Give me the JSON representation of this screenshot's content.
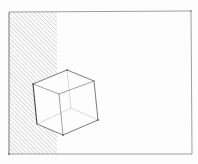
{
  "drawing": {
    "subject": "pencil sketch of wireframe cube beside hatched wall",
    "colors": {
      "paper": "#fdfdfd",
      "line": "#5a5a5a",
      "light_line": "#9a9a9a",
      "hatch": "#a8a8a8"
    },
    "frame": {
      "x1": 9,
      "y1": 12,
      "x2": 191,
      "y2": 154
    },
    "hatch_region": {
      "x1": 9,
      "y1": 12,
      "x2": 57,
      "y2": 154
    },
    "cube": {
      "vertices": {
        "top": [
          67,
          70
        ],
        "left": [
          33,
          84
        ],
        "right": [
          94,
          81
        ],
        "front_top": [
          59,
          94
        ],
        "bottom_left": [
          37,
          124
        ],
        "bottom": [
          63,
          135
        ],
        "bottom_right": [
          98,
          120
        ],
        "hidden": [
          71,
          108
        ]
      }
    }
  }
}
